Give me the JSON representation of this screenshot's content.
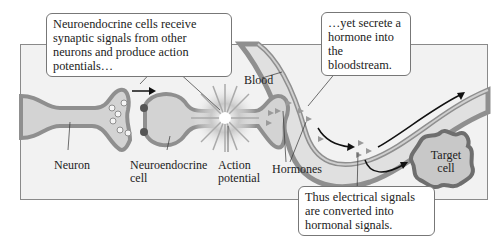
{
  "callouts": {
    "top_left": "Neuroendocrine cells receive synaptic signals from other neurons and produce action potentials…",
    "top_right": "…yet secrete a hormone into the bloodstream.",
    "bottom": "Thus electrical signals are converted into hormonal signals."
  },
  "labels": {
    "blood": "Blood",
    "neuron": "Neuron",
    "neuroendocrine_cell": "Neuroendocrine cell",
    "action_potential": "Action potential",
    "hormones": "Hormones",
    "target_cell": "Target cell"
  },
  "colors": {
    "panel_bg": "#f2f2f2",
    "cell_fill": "#d3d3d3",
    "membrane": "#8f8f8f",
    "blood_fill": "#e0e0e0",
    "callout_border": "#777777"
  }
}
